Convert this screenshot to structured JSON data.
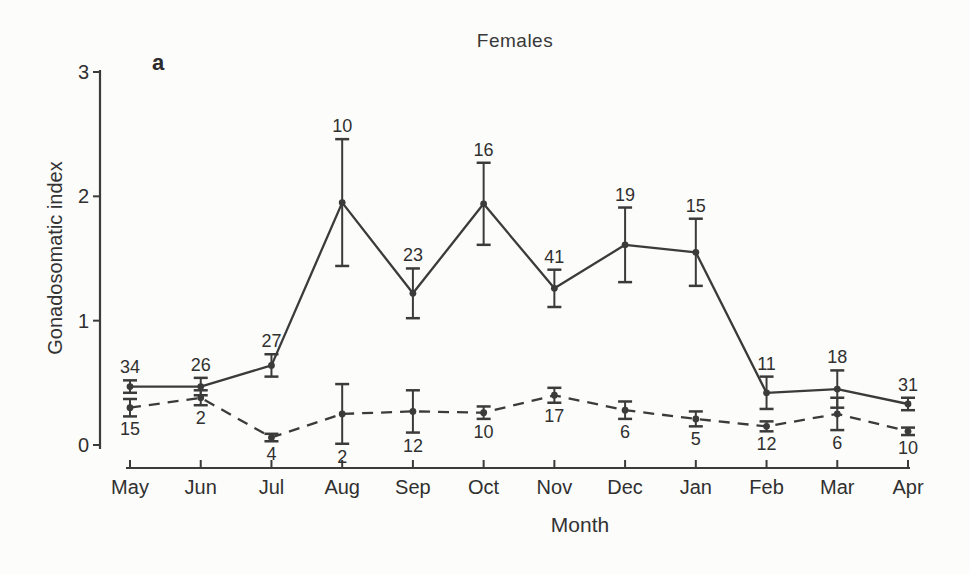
{
  "chart_data": {
    "type": "line",
    "title": "Females",
    "panel_label": "a",
    "xlabel": "Month",
    "ylabel": "Gonadosomatic index",
    "ylim": [
      0,
      3
    ],
    "yticks": [
      0,
      1,
      2,
      3
    ],
    "grid": false,
    "legend": "none",
    "categories": [
      "May",
      "Jun",
      "Jul",
      "Aug",
      "Sep",
      "Oct",
      "Nov",
      "Dec",
      "Jan",
      "Feb",
      "Mar",
      "Apr"
    ],
    "series": [
      {
        "name": "upper-series-solid",
        "line_style": "solid",
        "marker": "filled-circle",
        "error_bars": true,
        "label_position": "above",
        "values": [
          0.47,
          0.47,
          0.64,
          1.95,
          1.22,
          1.94,
          1.26,
          1.61,
          1.55,
          0.42,
          0.45,
          0.33
        ],
        "errors": [
          0.05,
          0.07,
          0.09,
          0.51,
          0.2,
          0.33,
          0.15,
          0.3,
          0.27,
          0.13,
          0.15,
          0.05
        ],
        "sample_sizes": [
          34,
          26,
          27,
          10,
          23,
          16,
          41,
          19,
          15,
          11,
          18,
          31
        ]
      },
      {
        "name": "lower-series-dashed",
        "line_style": "dashed",
        "marker": "filled-circle",
        "error_bars": true,
        "label_position": "below",
        "values": [
          0.3,
          0.38,
          0.06,
          0.25,
          0.27,
          0.26,
          0.4,
          0.28,
          0.21,
          0.15,
          0.25,
          0.11
        ],
        "errors": [
          0.07,
          0.06,
          0.03,
          0.24,
          0.17,
          0.05,
          0.06,
          0.07,
          0.06,
          0.04,
          0.13,
          0.03
        ],
        "sample_sizes": [
          15,
          2,
          4,
          2,
          12,
          10,
          17,
          6,
          5,
          12,
          6,
          10
        ]
      }
    ],
    "colors": {
      "line": "#3b3b3b",
      "text": "#303030",
      "background": "#fcfcfa"
    }
  }
}
